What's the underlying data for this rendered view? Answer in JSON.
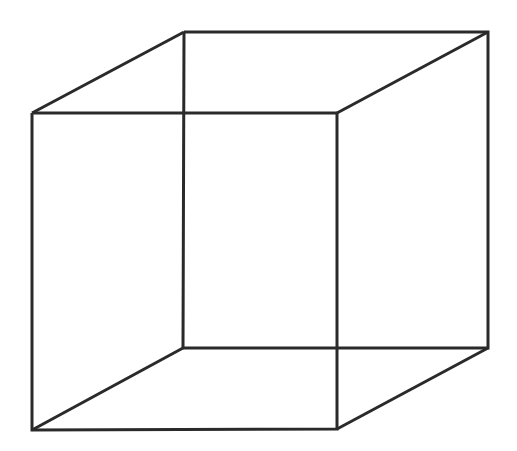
{
  "figure": {
    "kind": "wireframe-cube-line-drawing",
    "background_color": "#ffffff",
    "canvas": {
      "width": 517,
      "height": 451
    },
    "line": {
      "color": "#2b2a2a",
      "width": 3,
      "style": "solid"
    },
    "vertices": {
      "front_top_left": {
        "label": "front-top-left",
        "x": 32,
        "y": 113
      },
      "front_top_right": {
        "label": "front-top-right",
        "x": 337,
        "y": 113
      },
      "front_bottom_right": {
        "label": "front-bottom-right",
        "x": 337,
        "y": 429
      },
      "front_bottom_left": {
        "label": "front-bottom-left",
        "x": 32,
        "y": 430
      },
      "back_top_left": {
        "label": "back-top-left",
        "x": 184,
        "y": 32
      },
      "back_top_right": {
        "label": "back-top-right",
        "x": 488,
        "y": 32
      },
      "back_bottom_right": {
        "label": "back-bottom-right",
        "x": 488,
        "y": 348
      },
      "back_bottom_left": {
        "label": "back-bottom-left",
        "x": 183,
        "y": 348
      }
    },
    "edges": {
      "front_face": {
        "name": "front-square",
        "points": "32,113 337,113 337,429 32,430 32,113"
      },
      "back_face": {
        "name": "back-square",
        "points": "184,32 488,32 488,348 183,348 184,32"
      },
      "connector_top_left": {
        "name": "connector-top-left",
        "x1": 32,
        "y1": 113,
        "x2": 184,
        "y2": 32
      },
      "connector_top_right": {
        "name": "connector-top-right",
        "x1": 337,
        "y1": 113,
        "x2": 488,
        "y2": 32
      },
      "connector_bottom_right": {
        "name": "connector-bottom-right",
        "x1": 337,
        "y1": 429,
        "x2": 488,
        "y2": 348
      },
      "connector_bottom_left": {
        "name": "connector-bottom-left",
        "x1": 32,
        "y1": 430,
        "x2": 183,
        "y2": 348
      }
    },
    "labels": {
      "text_items": []
    }
  }
}
